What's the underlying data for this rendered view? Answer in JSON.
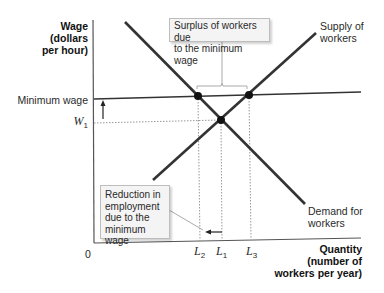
{
  "axes": {
    "y_label": [
      "Wage",
      "(dollars",
      "per hour)"
    ],
    "x_label": [
      "Quantity",
      "(number of",
      "workers per year)"
    ],
    "origin": "0"
  },
  "levels": {
    "minimum_wage": "Minimum wage",
    "w1": {
      "base": "W",
      "sub": "1"
    }
  },
  "quantities": {
    "l2": {
      "base": "L",
      "sub": "2"
    },
    "l1": {
      "base": "L",
      "sub": "1"
    },
    "l3": {
      "base": "L",
      "sub": "3"
    }
  },
  "curves": {
    "supply_label": [
      "Supply of",
      "workers"
    ],
    "demand_label": [
      "Demand for",
      "workers"
    ]
  },
  "callouts": {
    "surplus": [
      "Surplus of workers due",
      "to the minimum wage"
    ],
    "reduction": [
      "Reduction in",
      "employment",
      "due to the",
      "minimum wage"
    ]
  },
  "colors": {
    "curve": "#333333",
    "axis": "#555555",
    "dotted": "#999999",
    "box_bg": "#f4f4f4",
    "box_border": "#bdbdbd"
  }
}
